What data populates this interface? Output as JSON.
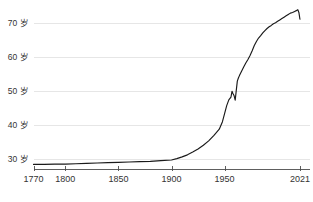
{
  "chart_data": {
    "type": "line",
    "title": "",
    "subtitle": "",
    "xlabel": "",
    "ylabel": "",
    "unit_suffix": "岁",
    "xlim": [
      1770,
      2030
    ],
    "ylim": [
      27.5,
      74.5
    ],
    "grid": true,
    "grid_axis": "y",
    "legend": "none",
    "line_color": "#1a1a1a",
    "grid_color": "#e6e6e6",
    "axis_color": "#4d4d4d",
    "x_ticks": [
      1770,
      1800,
      1850,
      1900,
      1950,
      2021
    ],
    "x_tick_labels": [
      "1770",
      "1800",
      "1850",
      "1900",
      "1950",
      "2021"
    ],
    "y_ticks": [
      30,
      40,
      50,
      60,
      70
    ],
    "y_tick_labels": [
      "30 岁",
      "40 岁",
      "50 岁",
      "60 岁",
      "70 岁"
    ],
    "series": [
      {
        "name": "life-expectancy",
        "x": [
          1770,
          1780,
          1790,
          1800,
          1810,
          1820,
          1830,
          1840,
          1850,
          1860,
          1870,
          1880,
          1890,
          1900,
          1905,
          1910,
          1915,
          1920,
          1925,
          1930,
          1935,
          1940,
          1945,
          1948,
          1950,
          1952,
          1954,
          1956,
          1957,
          1958,
          1959,
          1960,
          1961,
          1962,
          1963,
          1964,
          1966,
          1968,
          1970,
          1972,
          1974,
          1976,
          1978,
          1980,
          1982,
          1984,
          1986,
          1988,
          1990,
          1992,
          1994,
          1996,
          1998,
          2000,
          2002,
          2004,
          2006,
          2008,
          2010,
          2012,
          2014,
          2016,
          2018,
          2019,
          2020,
          2021
        ],
        "values": [
          28.7,
          28.7,
          28.8,
          28.8,
          28.9,
          29.0,
          29.1,
          29.2,
          29.3,
          29.4,
          29.5,
          29.6,
          29.8,
          30.0,
          30.4,
          30.9,
          31.5,
          32.3,
          33.2,
          34.3,
          35.6,
          37.2,
          39.0,
          41.2,
          43.6,
          45.9,
          47.6,
          48.4,
          50.1,
          49.4,
          48.8,
          47.5,
          50.3,
          53.1,
          54.0,
          54.7,
          56.0,
          57.2,
          58.4,
          59.4,
          60.6,
          62.0,
          63.5,
          64.7,
          65.7,
          66.4,
          67.2,
          67.9,
          68.5,
          69.0,
          69.4,
          69.9,
          70.2,
          70.6,
          71.0,
          71.4,
          71.8,
          72.2,
          72.6,
          73.0,
          73.2,
          73.5,
          73.8,
          74.0,
          73.2,
          71.2
        ]
      }
    ]
  },
  "axes": {
    "y_labels": [
      "70 岁",
      "60 岁",
      "50 岁",
      "40 岁",
      "30 岁"
    ],
    "x_labels": [
      "1770",
      "1800",
      "1850",
      "1900",
      "1950",
      "2021"
    ]
  }
}
